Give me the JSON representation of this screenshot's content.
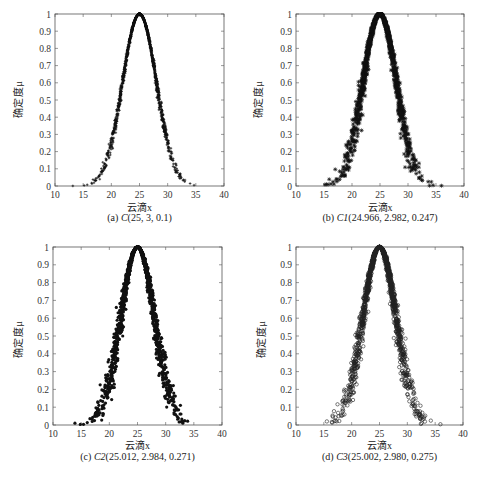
{
  "figure": {
    "axis": {
      "ylabel": "确定度μ",
      "xlabel": "云滴x",
      "xticks": [
        10,
        15,
        20,
        25,
        30,
        35,
        40
      ],
      "yticks": [
        0,
        0.1,
        0.2,
        0.3,
        0.4,
        0.5,
        0.6,
        0.7,
        0.8,
        0.9,
        1
      ],
      "ytick_labels": [
        "0",
        "0.1",
        "0.2",
        "0.3",
        "0.4",
        "0.5",
        "0.6",
        "0.7",
        "0.8",
        "0.9",
        "1"
      ],
      "xlim": [
        10,
        40
      ],
      "ylim": [
        0,
        1
      ]
    },
    "captions": {
      "a": {
        "prefix": "(a) ",
        "name": "C",
        "params": "(25, 3, 0.1)"
      },
      "b": {
        "prefix": "(b) ",
        "name": "C1",
        "params": "(24.966, 2.982, 0.247)"
      },
      "c": {
        "prefix": "(c) ",
        "name": "C2",
        "params": "(25.012, 2.984, 0.271)"
      },
      "d": {
        "prefix": "(d) ",
        "name": "C3",
        "params": "(25.002, 2.980, 0.275)"
      }
    }
  },
  "chart_data": [
    {
      "type": "scatter",
      "title": "(a) C(25, 3, 0.1)",
      "xlabel": "云滴x",
      "ylabel": "确定度μ",
      "xlim": [
        10,
        40
      ],
      "ylim": [
        0,
        1
      ],
      "grid": false,
      "marker": "plus",
      "model": {
        "Ex": 25,
        "En": 3,
        "He": 0.1,
        "drops": 1500
      },
      "x_range_observed": [
        14,
        35
      ],
      "peak": {
        "x": 25,
        "y": 1.0
      }
    },
    {
      "type": "scatter",
      "title": "(b) C1(24.966, 2.982, 0.247)",
      "xlabel": "云滴x",
      "ylabel": "确定度μ",
      "xlim": [
        10,
        40
      ],
      "ylim": [
        0,
        1
      ],
      "grid": false,
      "marker": "star",
      "model": {
        "Ex": 24.966,
        "En": 2.982,
        "He": 0.247,
        "drops": 1500
      },
      "x_range_observed": [
        12,
        38
      ],
      "peak": {
        "x": 25,
        "y": 1.0
      }
    },
    {
      "type": "scatter",
      "title": "(c) C2(25.012, 2.984, 0.271)",
      "xlabel": "云滴x",
      "ylabel": "确定度μ",
      "xlim": [
        10,
        40
      ],
      "ylim": [
        0,
        1
      ],
      "grid": false,
      "marker": "dot",
      "model": {
        "Ex": 25.012,
        "En": 2.984,
        "He": 0.271,
        "drops": 1500
      },
      "x_range_observed": [
        13,
        36
      ],
      "peak": {
        "x": 25,
        "y": 1.0
      }
    },
    {
      "type": "scatter",
      "title": "(d) C3(25.002, 2.980, 0.275)",
      "xlabel": "云滴x",
      "ylabel": "确定度μ",
      "xlim": [
        10,
        40
      ],
      "ylim": [
        0,
        1
      ],
      "grid": false,
      "marker": "circle",
      "model": {
        "Ex": 25.002,
        "En": 2.98,
        "He": 0.275,
        "drops": 1500
      },
      "x_range_observed": [
        13,
        38
      ],
      "peak": {
        "x": 25,
        "y": 1.0
      }
    }
  ],
  "layout": {
    "panels": [
      {
        "id": "a",
        "plot": {
          "left": 55,
          "top": 14,
          "width": 169,
          "height": 172
        }
      },
      {
        "id": "b",
        "plot": {
          "left": 296,
          "top": 14,
          "width": 168,
          "height": 172
        }
      },
      {
        "id": "c",
        "plot": {
          "left": 53,
          "top": 247,
          "width": 169,
          "height": 178
        }
      },
      {
        "id": "d",
        "plot": {
          "left": 296,
          "top": 247,
          "width": 167,
          "height": 178
        }
      }
    ]
  }
}
